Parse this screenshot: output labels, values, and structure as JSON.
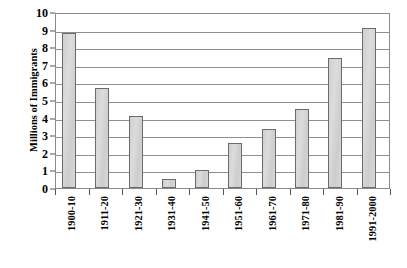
{
  "chart_data": {
    "type": "bar",
    "title": "",
    "subtitle": "",
    "xlabel": "",
    "ylabel": "Millions of Immigrants",
    "categories": [
      "1900-10",
      "1911-20",
      "1921-30",
      "1931-40",
      "1941-50",
      "1951-60",
      "1961-70",
      "1971-80",
      "1981-90",
      "1991-2000"
    ],
    "values": [
      8.8,
      5.7,
      4.1,
      0.5,
      1.05,
      2.55,
      3.35,
      4.5,
      7.4,
      9.1
    ],
    "ylim": [
      0,
      10
    ],
    "y_ticks": [
      0,
      1,
      2,
      3,
      4,
      5,
      6,
      7,
      8,
      9,
      10
    ],
    "y_tick_labels": [
      "0",
      "1",
      "2",
      "3",
      "4",
      "5",
      "6",
      "7",
      "8",
      "9",
      "10"
    ],
    "grid": true,
    "grid_axis": "y",
    "legend": false,
    "legend_position": "none",
    "annotations": [],
    "colors": {
      "bar_fill": "#d3d3d3",
      "bar_border": "#6b6b6b",
      "gridline": "#8f8f8f",
      "axis": "#8a8a8a",
      "text": "#000000",
      "background": "#ffffff"
    }
  }
}
